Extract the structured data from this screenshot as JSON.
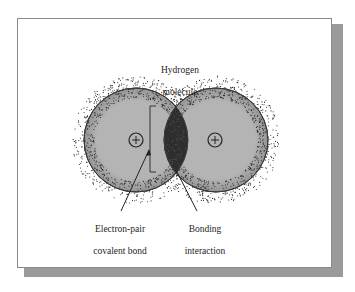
{
  "figure": {
    "title": "Hydrogen molecule",
    "title_lines": [
      "Hydrogen",
      "molecule"
    ],
    "labels": {
      "electron_pair": {
        "line1": "Electron-pair",
        "line2": "covalent bond"
      },
      "bonding": {
        "line1": "Bonding",
        "line2": "interaction"
      }
    },
    "atoms": [
      {
        "name": "left-hydrogen-atom",
        "nucleus_symbol": "+",
        "cx": 136,
        "cy": 140,
        "r": 52
      },
      {
        "name": "right-hydrogen-atom",
        "nucleus_symbol": "+",
        "cx": 216,
        "cy": 140,
        "r": 52
      }
    ],
    "colors": {
      "atom_fill": "#b4b4b4",
      "overlap_fill": "#2e2e2e",
      "outline": "#3a3a3a",
      "dots": "#2a2a2a",
      "shadow": "#9a9a9a"
    }
  }
}
